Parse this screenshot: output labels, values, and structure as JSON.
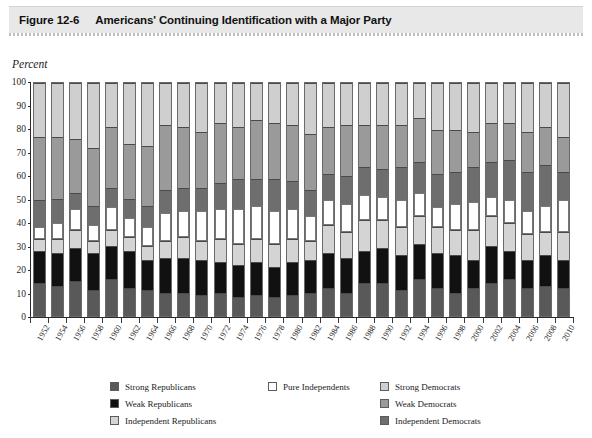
{
  "figure": {
    "number": "Figure 12-6",
    "title": "Americans' Continuing Identification with a Major Party"
  },
  "axis": {
    "y_label": "Percent",
    "y_ticks": [
      "0",
      "10",
      "20",
      "30",
      "40",
      "50",
      "60",
      "70",
      "80",
      "90",
      "100"
    ]
  },
  "colors": {
    "strong_republicans": "#595959",
    "weak_republicans": "#111111",
    "independent_republicans": "#d4d4d4",
    "pure_independents": "#ffffff",
    "independent_democrats": "#6e6e6e",
    "weak_democrats": "#9a9a9a",
    "strong_democrats": "#cfcfcf",
    "header_band": "#e8e8e8",
    "axis": "#2a2a2a"
  },
  "legend": {
    "columns": [
      {
        "items": [
          {
            "label": "Strong Republicans",
            "swatch": "#595959",
            "key": "strong_republicans"
          },
          {
            "label": "Weak Republicans",
            "swatch": "#111111",
            "key": "weak_republicans"
          },
          {
            "label": "Independent Republicans",
            "swatch": "#d4d4d4",
            "key": "independent_republicans"
          }
        ]
      },
      {
        "items": [
          {
            "label": "Pure Independents",
            "swatch": "#ffffff",
            "key": "pure_independents"
          }
        ]
      },
      {
        "items": [
          {
            "label": "Strong Democrats",
            "swatch": "#cfcfcf",
            "key": "strong_democrats"
          },
          {
            "label": "Weak Democrats",
            "swatch": "#9a9a9a",
            "key": "weak_democrats"
          },
          {
            "label": "Independent Democrats",
            "swatch": "#6e6e6e",
            "key": "independent_democrats"
          }
        ]
      }
    ]
  },
  "chart_data": {
    "type": "bar",
    "stacked": true,
    "stack_total": 100,
    "title": "Americans' Continuing Identification with a Major Party",
    "xlabel": "",
    "ylabel": "Percent",
    "ylim": [
      0,
      100
    ],
    "grid": false,
    "legend_position": "bottom",
    "categories": [
      "1952",
      "1954",
      "1956",
      "1958",
      "1960",
      "1962",
      "1964",
      "1966",
      "1968",
      "1970",
      "1972",
      "1974",
      "1976",
      "1978",
      "1980",
      "1982",
      "1984",
      "1986",
      "1988",
      "1990",
      "1992",
      "1994",
      "1996",
      "1998",
      "2000",
      "2002",
      "2004",
      "2006",
      "2008",
      "2010"
    ],
    "stack_order_bottom_to_top": [
      "Strong Republicans",
      "Weak Republicans",
      "Independent Republicans",
      "Pure Independents",
      "Independent Democrats",
      "Weak Democrats",
      "Strong Democrats"
    ],
    "series": [
      {
        "name": "Strong Republicans",
        "color": "#595959",
        "values": [
          14,
          13,
          15,
          11,
          16,
          12,
          11,
          10,
          10,
          9,
          10,
          8,
          9,
          8,
          9,
          10,
          12,
          10,
          14,
          14,
          11,
          16,
          12,
          10,
          12,
          14,
          16,
          12,
          13,
          12
        ]
      },
      {
        "name": "Weak Republicans",
        "color": "#111111",
        "values": [
          14,
          14,
          14,
          16,
          14,
          16,
          13,
          15,
          15,
          15,
          13,
          14,
          14,
          13,
          14,
          14,
          15,
          15,
          14,
          15,
          15,
          15,
          15,
          16,
          12,
          16,
          12,
          12,
          13,
          12
        ]
      },
      {
        "name": "Independent Republicans",
        "color": "#d4d4d4",
        "values": [
          5,
          6,
          8,
          5,
          7,
          6,
          6,
          7,
          9,
          8,
          10,
          9,
          10,
          10,
          10,
          8,
          12,
          11,
          13,
          12,
          12,
          12,
          11,
          11,
          13,
          13,
          12,
          11,
          10,
          12
        ]
      },
      {
        "name": "Pure Independents",
        "color": "#ffffff",
        "values": [
          5,
          7,
          9,
          7,
          10,
          8,
          8,
          12,
          11,
          13,
          13,
          15,
          14,
          14,
          13,
          11,
          11,
          12,
          11,
          10,
          12,
          10,
          9,
          11,
          12,
          8,
          10,
          10,
          11,
          14
        ]
      },
      {
        "name": "Independent Democrats",
        "color": "#6e6e6e",
        "values": [
          12,
          10,
          7,
          8,
          8,
          8,
          9,
          10,
          10,
          10,
          11,
          13,
          12,
          14,
          12,
          11,
          11,
          12,
          12,
          12,
          14,
          13,
          14,
          14,
          15,
          15,
          17,
          17,
          18,
          12
        ]
      },
      {
        "name": "Weak Democrats",
        "color": "#9a9a9a",
        "values": [
          27,
          27,
          23,
          25,
          26,
          24,
          26,
          28,
          26,
          24,
          26,
          22,
          25,
          24,
          24,
          24,
          20,
          22,
          18,
          19,
          18,
          19,
          19,
          18,
          15,
          17,
          16,
          17,
          16,
          15
        ]
      },
      {
        "name": "Strong Democrats",
        "color": "#cfcfcf",
        "values": [
          23,
          23,
          24,
          28,
          19,
          26,
          27,
          18,
          19,
          21,
          17,
          19,
          16,
          17,
          18,
          22,
          19,
          18,
          18,
          18,
          18,
          15,
          20,
          20,
          21,
          17,
          17,
          21,
          19,
          23
        ]
      }
    ]
  }
}
